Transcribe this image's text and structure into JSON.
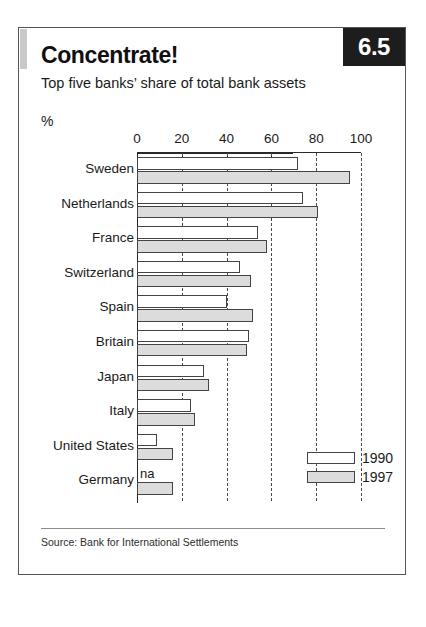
{
  "figure": {
    "number": "6.5",
    "title": "Concentrate!",
    "subtitle": "Top five banks’ share of total bank assets",
    "unit": "%",
    "source": "Source: Bank for International Settlements",
    "na_marker": "na"
  },
  "colors": {
    "badge_background": "#1d1d1d",
    "badge_text": "#ffffff",
    "series_1990": "#ffffff",
    "series_1997": "#dcdcdc",
    "bar_outline": "#444444",
    "frame": "#555555",
    "text": "#1a1a1a"
  },
  "chart_data": {
    "type": "bar",
    "orientation": "horizontal",
    "title": "Concentrate!",
    "subtitle": "Top five banks’ share of total bank assets",
    "xlabel": "%",
    "ylabel": "",
    "xlim": [
      0,
      100
    ],
    "xticks": [
      0,
      20,
      40,
      60,
      80,
      100
    ],
    "xtick_labels": [
      "0",
      "20",
      "40",
      "60",
      "80",
      "100"
    ],
    "grid": true,
    "legend_position": "bottom-right",
    "categories": [
      "Sweden",
      "Netherlands",
      "France",
      "Switzerland",
      "Spain",
      "Britain",
      "Japan",
      "Italy",
      "United States",
      "Germany"
    ],
    "series": [
      {
        "name": "1990",
        "values": [
          72,
          74,
          54,
          46,
          40,
          50,
          30,
          24,
          9,
          null
        ]
      },
      {
        "name": "1997",
        "values": [
          95,
          81,
          58,
          51,
          52,
          49,
          32,
          26,
          16,
          16
        ]
      }
    ],
    "source": "Source: Bank for International Settlements"
  }
}
